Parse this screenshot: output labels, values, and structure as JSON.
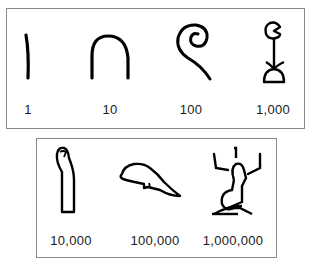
{
  "rows": [
    {
      "numerals": [
        {
          "value": "1",
          "glyph": "stroke-icon"
        },
        {
          "value": "10",
          "glyph": "heel-bone-icon"
        },
        {
          "value": "100",
          "glyph": "coiled-rope-icon"
        },
        {
          "value": "1,000",
          "glyph": "lotus-plant-icon"
        }
      ]
    },
    {
      "numerals": [
        {
          "value": "10,000",
          "glyph": "finger-icon"
        },
        {
          "value": "100,000",
          "glyph": "tadpole-icon"
        },
        {
          "value": "1,000,000",
          "glyph": "heh-god-icon"
        }
      ]
    }
  ]
}
